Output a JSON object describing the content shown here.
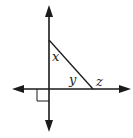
{
  "diagram": {
    "type": "geometry",
    "colors": {
      "line": "#1a1a1a",
      "background": "#ffffff",
      "text": "#222222"
    },
    "angle_labels": {
      "x": "x",
      "y": "y",
      "z": "z"
    },
    "right_angle_marker": true,
    "lines": [
      {
        "name": "vertical-line",
        "arrows": "both"
      },
      {
        "name": "horizontal-line",
        "arrows": "both"
      },
      {
        "name": "transversal-segment",
        "arrows": "none"
      }
    ]
  }
}
